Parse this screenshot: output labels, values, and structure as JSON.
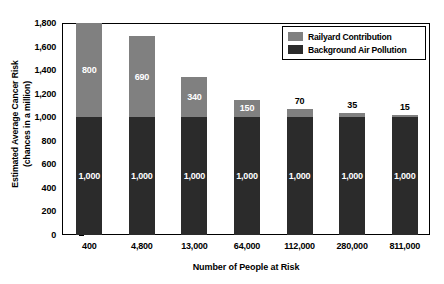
{
  "chart_data": {
    "type": "bar",
    "subtype": "stacked-bar",
    "title": "",
    "xlabel": "Number of People at Risk",
    "ylabel": "Estimated Average Cancer Risk (chances in a million)",
    "ylabel_line1": "Estimated Average Cancer Risk",
    "ylabel_line2": "(chances in a million)",
    "categories": [
      "400",
      "4,800",
      "13,000",
      "64,000",
      "112,000",
      "280,000",
      "811,000"
    ],
    "series": [
      {
        "name": "Background Air Pollution",
        "color": "#2b2b2b",
        "values": [
          1000,
          1000,
          1000,
          1000,
          1000,
          1000,
          1000
        ],
        "labels": [
          "1,000",
          "1,000",
          "1,000",
          "1,000",
          "1,000",
          "1,000",
          "1,000"
        ]
      },
      {
        "name": "Railyard Contribution",
        "color": "#808080",
        "values": [
          800,
          690,
          340,
          150,
          70,
          35,
          15
        ],
        "labels": [
          "800",
          "690",
          "340",
          "150",
          "70",
          "35",
          "15"
        ]
      }
    ],
    "totals": [
      1800,
      1690,
      1340,
      1150,
      1070,
      1035,
      1015
    ],
    "ylim": [
      0,
      1800
    ],
    "ytick_values": [
      0,
      200,
      400,
      600,
      800,
      1000,
      1200,
      1400,
      1600,
      1800
    ],
    "ytick_labels": [
      "0",
      "200",
      "400",
      "600",
      "800",
      "1,000",
      "1,200",
      "1,400",
      "1,600",
      "1,800"
    ],
    "grid": false,
    "legend_position": "top-right",
    "legend_entries": [
      {
        "label": "Railyard Contribution",
        "color": "#808080"
      },
      {
        "label": "Background Air Pollution",
        "color": "#2b2b2b"
      }
    ],
    "label_placement": [
      "inside",
      "inside",
      "inside",
      "inside",
      "outside",
      "outside",
      "outside"
    ]
  }
}
